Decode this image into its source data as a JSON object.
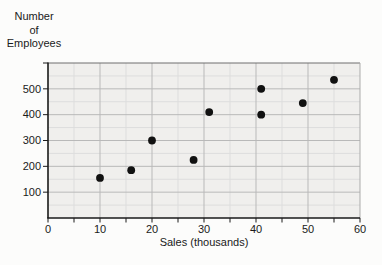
{
  "figure": {
    "y_axis_title_lines": [
      "Number",
      "of",
      "Employees"
    ]
  },
  "chart_data": {
    "type": "scatter",
    "title": "",
    "xlabel": "Sales (thousands)",
    "ylabel": "Number of Employees",
    "xlim": [
      0,
      60
    ],
    "ylim": [
      0,
      600
    ],
    "x_major_ticks": [
      0,
      10,
      20,
      30,
      40,
      50,
      60
    ],
    "x_minor_tick_step": 5,
    "y_major_ticks": [
      100,
      200,
      300,
      400,
      500
    ],
    "y_minor_grid_step": 50,
    "grid": "major and minor, on light gray panel",
    "legend": "none",
    "points": [
      [
        10,
        155
      ],
      [
        16,
        185
      ],
      [
        20,
        300
      ],
      [
        28,
        225
      ],
      [
        31,
        410
      ],
      [
        41,
        400
      ],
      [
        41,
        500
      ],
      [
        49,
        445
      ],
      [
        55,
        535
      ]
    ],
    "colors": {
      "point": "#111111",
      "plot_bg": "#f0efed",
      "grid_major": "#b9b9b9",
      "grid_minor": "#dddddd",
      "frame_top": "#6e6e6e",
      "frame_right": "#ababab",
      "axis": "#1a1a1a",
      "text": "#1a1a1a"
    }
  }
}
